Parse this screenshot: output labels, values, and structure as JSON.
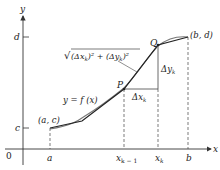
{
  "diagram": {
    "type": "arc-length-approximation",
    "axes": {
      "x_label": "x",
      "y_label": "y",
      "origin_label": "0"
    },
    "y_ticks": [
      {
        "label": "d"
      },
      {
        "label": "c"
      }
    ],
    "x_ticks": [
      {
        "label": "a"
      },
      {
        "label": "x",
        "sub": "k − 1"
      },
      {
        "label": "x",
        "sub": "k"
      },
      {
        "label": "b"
      }
    ],
    "points": {
      "start": "(a, c)",
      "end": "(b, d)",
      "P": "P",
      "Q": "Q"
    },
    "curve_label": "y = f (x)",
    "segment_length_label": {
      "prefix": "√",
      "text": "(Δx",
      "sub1": "k",
      "mid": ")² + (Δy",
      "sub2": "k",
      "suffix": ")²"
    },
    "delta_x": {
      "text": "Δx",
      "sub": "k"
    },
    "delta_y": {
      "text": "Δy",
      "sub": "k"
    },
    "colors": {
      "axis": "#333333",
      "curve": "#555555",
      "polygon": "#333333",
      "dashed": "#444444"
    }
  }
}
